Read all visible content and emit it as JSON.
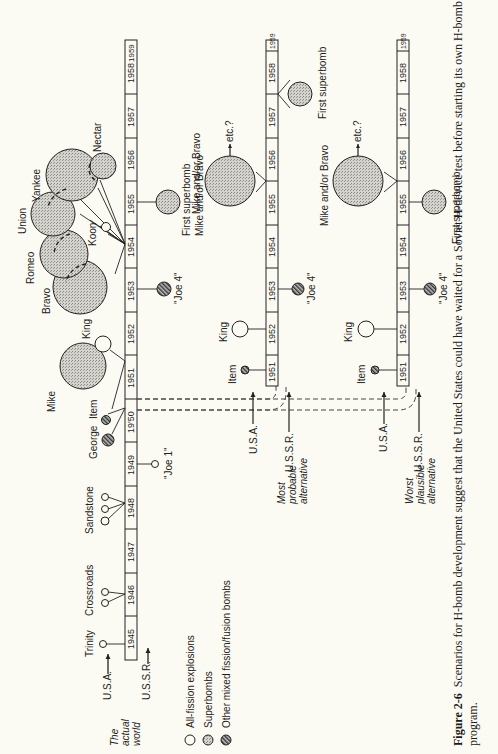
{
  "figure": {
    "number": "Figure 2-6",
    "caption": "Scenarios for H-bomb development suggest that the United States could have waited for a Soviet H-device test before starting its own H-bomb",
    "caption_line2": "program."
  },
  "legend": [
    {
      "label": "All-fission explosions",
      "style": "open"
    },
    {
      "label": "Superbombs",
      "style": "stippled"
    },
    {
      "label": "Other mixed fission/fusion bombs",
      "style": "hatched"
    }
  ],
  "rows": [
    {
      "id": "actual",
      "title_lines": [
        "The",
        "actual",
        "world"
      ],
      "usa_label": "U.S.A.",
      "ussr_label": "U.S.S.R.",
      "years": [
        "1945",
        "1946",
        "1947",
        "1948",
        "1949",
        "19'50",
        "1951",
        "1952",
        "1953",
        "1954",
        "1955",
        "1956",
        "1957",
        "1958",
        "1959"
      ],
      "usa_events": [
        {
          "label": "Trinity",
          "year": "1945",
          "type": "all-fission"
        },
        {
          "label": "Crossroads",
          "year": "1946",
          "type": "all-fission"
        },
        {
          "label": "Sandstone",
          "year": "1948",
          "type": "all-fission"
        },
        {
          "label": "George",
          "year": "1951",
          "type": "mixed"
        },
        {
          "label": "Item",
          "year": "1951",
          "type": "mixed"
        },
        {
          "label": "Mike",
          "year": "1952",
          "type": "superbomb"
        },
        {
          "label": "King",
          "year": "1952",
          "type": "all-fission"
        },
        {
          "label": "Bravo",
          "year": "1954",
          "type": "superbomb"
        },
        {
          "label": "Romeo",
          "year": "1954",
          "type": "superbomb"
        },
        {
          "label": "Koon",
          "year": "1954",
          "type": "all-fission"
        },
        {
          "label": "Union",
          "year": "1954",
          "type": "superbomb"
        },
        {
          "label": "Yankee",
          "year": "1954",
          "type": "superbomb"
        },
        {
          "label": "Nectar",
          "year": "1954",
          "type": "superbomb"
        }
      ],
      "ussr_events": [
        {
          "label": "\"Joe 1\"",
          "year": "1949",
          "type": "all-fission"
        },
        {
          "label": "\"Joe 4\"",
          "year": "1953",
          "type": "mixed"
        },
        {
          "label": "First superbomb",
          "year": "1955",
          "type": "superbomb"
        }
      ]
    },
    {
      "id": "most-probable",
      "title_lines": [
        "Most",
        "probable",
        "alternative"
      ],
      "usa_label": "U.S.A.",
      "ussr_label": "U.S.S.R.",
      "years": [
        "1951",
        "1952",
        "1953",
        "1954",
        "1955",
        "1956",
        "1957",
        "1958",
        "1959"
      ],
      "usa_events": [
        {
          "label": "Item",
          "year": "1951",
          "type": "mixed"
        },
        {
          "label": "King",
          "year": "1952",
          "type": "all-fission"
        },
        {
          "label": "Mike and/or Bravo",
          "year": "1955-1956",
          "type": "superbomb",
          "note": "etc.?"
        }
      ],
      "ussr_events": [
        {
          "label": "\"Joe 4\"",
          "year": "1953",
          "type": "mixed"
        },
        {
          "label": "First superbomb",
          "year": "1958-1959",
          "type": "superbomb"
        }
      ]
    },
    {
      "id": "worst-plausible",
      "title_lines": [
        "Worst",
        "plausible",
        "alternative"
      ],
      "usa_label": "U.S.A.",
      "ussr_label": "U.S.S.R.",
      "years": [
        "1951",
        "1952",
        "1953",
        "1954",
        "1955",
        "1956",
        "1957",
        "1958",
        "1959"
      ],
      "usa_events": [
        {
          "label": "Item",
          "year": "1951",
          "type": "mixed"
        },
        {
          "label": "King",
          "year": "1952",
          "type": "all-fission"
        },
        {
          "label": "Mike and/or Bravo",
          "year": "1955-1956",
          "type": "superbomb",
          "note": "etc.?"
        }
      ],
      "ussr_events": [
        {
          "label": "\"Joe 4\"",
          "year": "1953",
          "type": "mixed"
        },
        {
          "label": "First superbomb",
          "year": "1955",
          "type": "superbomb"
        }
      ]
    }
  ],
  "notes": {
    "etc1": "etc.?",
    "etc2": "etc.?"
  }
}
